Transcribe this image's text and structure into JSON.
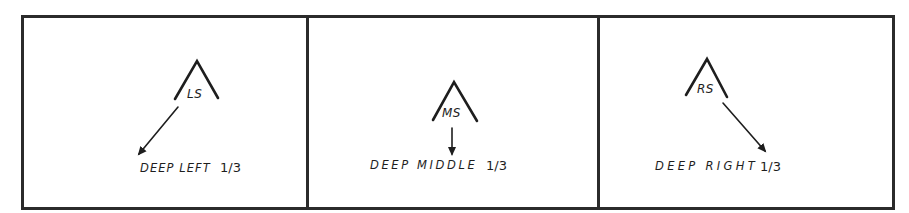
{
  "diagram": {
    "type": "football-coverage-zones",
    "panels": [
      {
        "id": "left",
        "player_label": "LS",
        "zone_label": "DEEP LEFT",
        "fraction": "1/3",
        "arrow_direction": "down-left"
      },
      {
        "id": "middle",
        "player_label": "MS",
        "zone_label": "DEEP MIDDLE",
        "fraction": "1/3",
        "arrow_direction": "down"
      },
      {
        "id": "right",
        "player_label": "RS",
        "zone_label": "DEEP RIGHT",
        "fraction": "1/3",
        "arrow_direction": "down-right"
      }
    ],
    "colors": {
      "ink": "#1e1e1e",
      "frame": "#2b2b2b",
      "background": "#ffffff"
    }
  }
}
